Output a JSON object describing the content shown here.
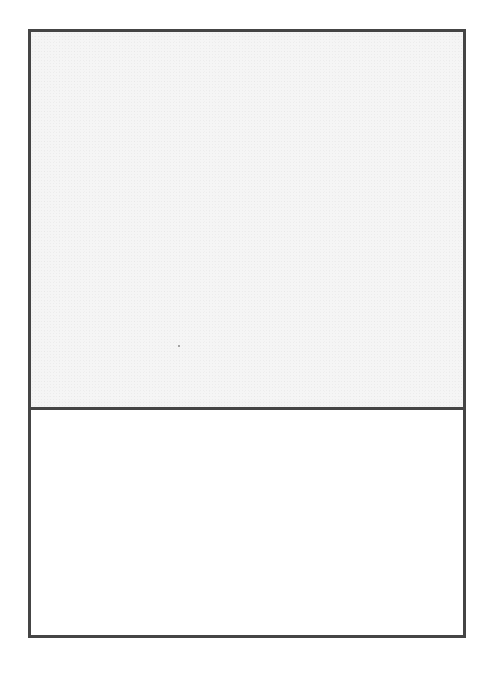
{
  "document": {
    "type": "blank two-panel frame",
    "panels": [
      {
        "id": "top",
        "label": "",
        "content": "",
        "fill": "#f5f5f5"
      },
      {
        "id": "bottom",
        "label": "",
        "content": "",
        "fill": "#ffffff"
      }
    ],
    "border_color": "#454545"
  }
}
